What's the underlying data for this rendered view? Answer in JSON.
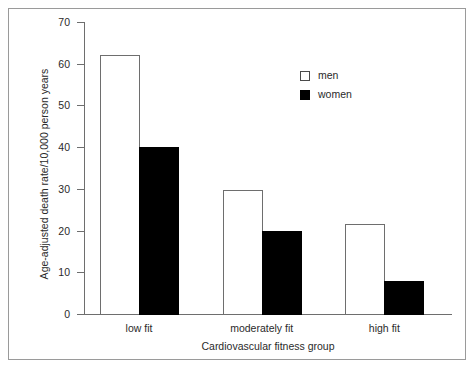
{
  "chart_data": {
    "type": "bar",
    "title": "",
    "subtitle": "",
    "xlabel": "Cardiovascular fitness group",
    "ylabel": "Age-adjusted death rate/10,000 person years",
    "categories": [
      "low fit",
      "moderately fit",
      "high fit"
    ],
    "series": [
      {
        "name": "men",
        "color": "#ffffff",
        "edge_color": "#6e6e6e",
        "values": [
          62,
          29.7,
          21.6
        ]
      },
      {
        "name": "women",
        "color": "#000000",
        "edge_color": "#000000",
        "values": [
          40,
          20,
          8
        ]
      }
    ],
    "ylim": [
      0,
      70
    ],
    "yticks": [
      0,
      10,
      20,
      30,
      40,
      50,
      60,
      70
    ],
    "ytick_labels": [
      "0",
      "10",
      "20",
      "30",
      "40",
      "50",
      "60",
      "70"
    ],
    "grid": false,
    "legend_position": "upper right",
    "legend_entries": [
      "men",
      "women"
    ],
    "annotations": []
  },
  "legend": {
    "men_label": "men",
    "women_label": "women"
  },
  "axes": {
    "y_title": "Age-adjusted death rate/10,000 person years",
    "x_title": "Cardiovascular fitness group"
  }
}
